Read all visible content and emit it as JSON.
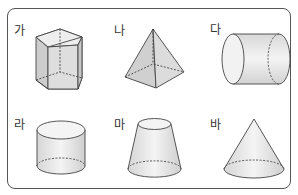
{
  "figures": [
    {
      "label": "가",
      "shape": "pentagonal-prism",
      "label_pos": [
        14,
        25
      ]
    },
    {
      "label": "나",
      "shape": "square-pyramid",
      "label_pos": [
        114,
        25
      ]
    },
    {
      "label": "다",
      "shape": "cylinder-horizontal",
      "label_pos": [
        210,
        24
      ]
    },
    {
      "label": "라",
      "shape": "cylinder-vertical",
      "label_pos": [
        14,
        119
      ]
    },
    {
      "label": "마",
      "shape": "truncated-cone",
      "label_pos": [
        114,
        119
      ]
    },
    {
      "label": "바",
      "shape": "cone",
      "label_pos": [
        210,
        119
      ]
    }
  ],
  "colors": {
    "frame": "#555555",
    "stroke": "#444444",
    "fill_light": "#eeeeee",
    "fill_mid": "#dcdcdc",
    "fill_dark": "#cfcfcf"
  }
}
